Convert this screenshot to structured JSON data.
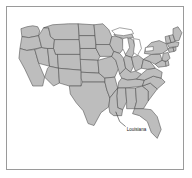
{
  "figure": {
    "background_color": "#ffffff",
    "frame_color": "#9a9a9a",
    "has_frame": true
  },
  "map": {
    "title": "",
    "region": "United States",
    "projection_style": "albers-usa",
    "default_state_fill": "#bdbdbd",
    "state_border_color": "#4a4a4a",
    "water_fill": "#ffffff",
    "highlighted_state": "Louisiana",
    "highlight_fill": "#ffffff"
  },
  "annotation": {
    "label": "Louisiana",
    "label_color": "#111111",
    "leader_line_color": "#2b2b2b",
    "anchor_state": "Louisiana"
  },
  "legend": {
    "visible": false,
    "entries": []
  }
}
